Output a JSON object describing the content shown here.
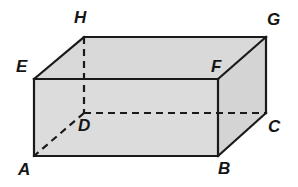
{
  "figure": {
    "name": "rectangular-prism-abcdefgh",
    "shape_type": "rectangular prism (cuboid)",
    "canvas": {
      "width": 298,
      "height": 187
    },
    "colors": {
      "background": "#ffffff",
      "front_face_fill": "#dcdcdc",
      "top_face_fill": "#d9d9d9",
      "right_face_fill": "#d4d4d4",
      "edge_stroke": "#1a1a1a",
      "hidden_edge_stroke": "#1a1a1a",
      "label_color": "#151515"
    },
    "stroke": {
      "visible_width": 2.2,
      "hidden_width": 2.2,
      "hidden_dash": "7 5"
    },
    "vertices": [
      {
        "id": "A",
        "x": 34,
        "y": 156,
        "label_x": 18,
        "label_y": 161,
        "hidden": false
      },
      {
        "id": "B",
        "x": 218,
        "y": 156,
        "label_x": 218,
        "label_y": 160,
        "hidden": false
      },
      {
        "id": "C",
        "x": 266,
        "y": 113,
        "label_x": 268,
        "label_y": 118,
        "hidden": false
      },
      {
        "id": "D",
        "x": 84,
        "y": 113,
        "label_x": 78,
        "label_y": 117,
        "hidden": true
      },
      {
        "id": "E",
        "x": 34,
        "y": 79,
        "label_x": 16,
        "label_y": 58,
        "hidden": false
      },
      {
        "id": "F",
        "x": 218,
        "y": 79,
        "label_x": 211,
        "label_y": 58,
        "hidden": false
      },
      {
        "id": "G",
        "x": 266,
        "y": 37,
        "label_x": 267,
        "label_y": 11,
        "hidden": false
      },
      {
        "id": "H",
        "x": 84,
        "y": 37,
        "label_x": 74,
        "label_y": 9,
        "hidden": false
      }
    ],
    "faces": [
      {
        "name": "front-face",
        "points": "34,79 218,79 218,156 34,156",
        "fill": "#dcdcdc"
      },
      {
        "name": "top-face",
        "points": "34,79 84,37 266,37 218,79",
        "fill": "#d9d9d9"
      },
      {
        "name": "right-face",
        "points": "218,79 266,37 266,113 218,156",
        "fill": "#d4d4d4"
      }
    ],
    "visible_edges": [
      {
        "name": "edge-EF",
        "from": "E",
        "to": "F",
        "x1": 34,
        "y1": 79,
        "x2": 218,
        "y2": 79
      },
      {
        "name": "edge-EA",
        "from": "E",
        "to": "A",
        "x1": 34,
        "y1": 79,
        "x2": 34,
        "y2": 156
      },
      {
        "name": "edge-AB",
        "from": "A",
        "to": "B",
        "x1": 34,
        "y1": 156,
        "x2": 218,
        "y2": 156
      },
      {
        "name": "edge-FB",
        "from": "F",
        "to": "B",
        "x1": 218,
        "y1": 79,
        "x2": 218,
        "y2": 156
      },
      {
        "name": "edge-EH",
        "from": "E",
        "to": "H",
        "x1": 34,
        "y1": 79,
        "x2": 84,
        "y2": 37
      },
      {
        "name": "edge-HG",
        "from": "H",
        "to": "G",
        "x1": 84,
        "y1": 37,
        "x2": 266,
        "y2": 37
      },
      {
        "name": "edge-FG",
        "from": "F",
        "to": "G",
        "x1": 218,
        "y1": 79,
        "x2": 266,
        "y2": 37
      },
      {
        "name": "edge-GC",
        "from": "G",
        "to": "C",
        "x1": 266,
        "y1": 37,
        "x2": 266,
        "y2": 113
      },
      {
        "name": "edge-BC",
        "from": "B",
        "to": "C",
        "x1": 218,
        "y1": 156,
        "x2": 266,
        "y2": 113
      }
    ],
    "hidden_edges": [
      {
        "name": "edge-HD",
        "from": "H",
        "to": "D",
        "x1": 84,
        "y1": 37,
        "x2": 84,
        "y2": 113
      },
      {
        "name": "edge-DC",
        "from": "D",
        "to": "C",
        "x1": 84,
        "y1": 113,
        "x2": 266,
        "y2": 113
      },
      {
        "name": "edge-DA",
        "from": "D",
        "to": "A",
        "x1": 84,
        "y1": 113,
        "x2": 34,
        "y2": 156
      }
    ]
  }
}
